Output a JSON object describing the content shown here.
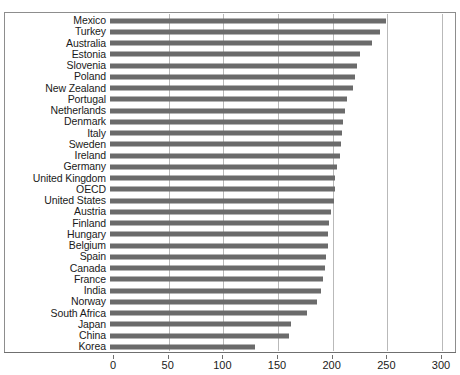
{
  "figure": {
    "cropped_title": "",
    "frame_border_color": "#8d8d8d",
    "bar_color": "#6b6b6b",
    "gridline_color": "#b9b9b9",
    "axis_color": "#6f6f6f",
    "background": "#ffffff"
  },
  "chart_data": {
    "type": "bar",
    "orientation": "horizontal",
    "title": "",
    "subtitle": "",
    "xlabel": "",
    "ylabel": "",
    "xlim": [
      0,
      300
    ],
    "ylim": null,
    "grid": true,
    "grid_axis": "x",
    "legend": null,
    "legend_position": "none",
    "sorted": "descending",
    "xticks": [
      0,
      50,
      100,
      150,
      200,
      250,
      300
    ],
    "xtick_labels": [
      "0",
      "50",
      "100",
      "150",
      "200",
      "250",
      "300"
    ],
    "categories": [
      "Mexico",
      "Turkey",
      "Australia",
      "Estonia",
      "Slovenia",
      "Poland",
      "New Zealand",
      "Portugal",
      "Netherlands",
      "Denmark",
      "Italy",
      "Sweden",
      "Ireland",
      "Germany",
      "United Kingdom",
      "OECD",
      "United States",
      "Austria",
      "Finland",
      "Hungary",
      "Belgium",
      "Spain",
      "Canada",
      "France",
      "India",
      "Norway",
      "South Africa",
      "Japan",
      "China",
      "Korea"
    ],
    "values": [
      252,
      247,
      240,
      229,
      226,
      224,
      222,
      217,
      215,
      213,
      212,
      211,
      210,
      208,
      206,
      206,
      205,
      202,
      200,
      199,
      199,
      198,
      197,
      195,
      193,
      189,
      180,
      166,
      164,
      133
    ],
    "series": [
      {
        "name": "value",
        "values": [
          252,
          247,
          240,
          229,
          226,
          224,
          222,
          217,
          215,
          213,
          212,
          211,
          210,
          208,
          206,
          206,
          205,
          202,
          200,
          199,
          199,
          198,
          197,
          195,
          193,
          189,
          180,
          166,
          164,
          133
        ]
      }
    ]
  }
}
